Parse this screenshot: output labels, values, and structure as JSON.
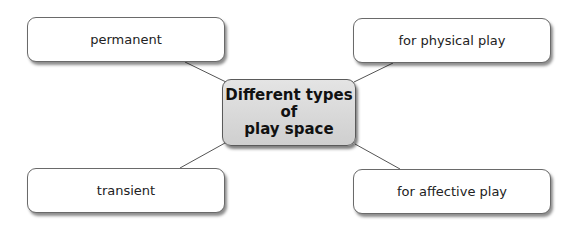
{
  "diagram": {
    "center": {
      "label": "Different types\nof\nplay space"
    },
    "nodes": [
      {
        "id": "top-left",
        "label": "permanent"
      },
      {
        "id": "top-right",
        "label": "for physical play"
      },
      {
        "id": "bottom-left",
        "label": "transient"
      },
      {
        "id": "bottom-right",
        "label": "for affective play"
      }
    ],
    "colors": {
      "center_fill": "#d8d8d8",
      "node_fill": "#ffffff",
      "border": "#6a6a6a",
      "connector": "#555555"
    }
  }
}
